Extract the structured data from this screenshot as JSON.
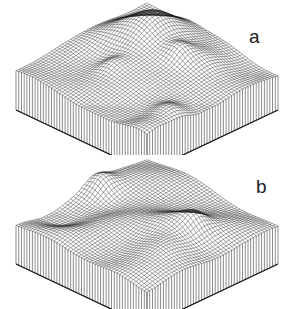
{
  "figure": {
    "panels": [
      {
        "id": "a",
        "label": "a",
        "seed": 3
      },
      {
        "id": "b",
        "label": "b",
        "seed": 11
      }
    ],
    "style": {
      "line_color": "#1a1a1a",
      "background": "#ffffff"
    }
  }
}
